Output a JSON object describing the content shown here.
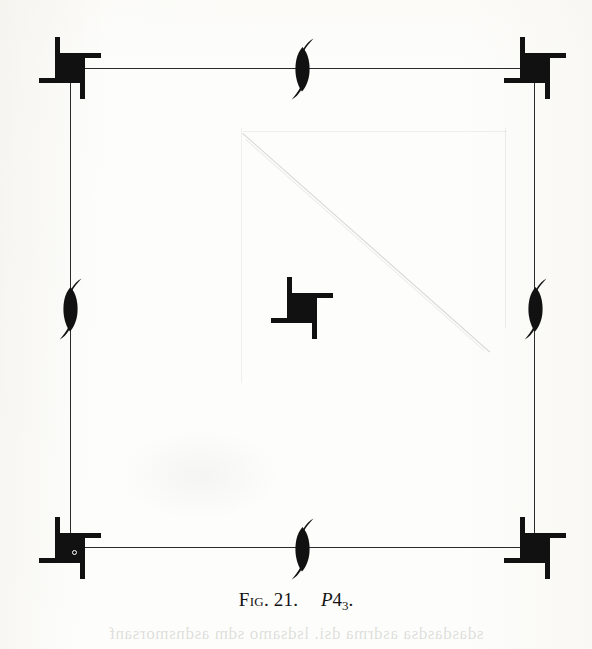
{
  "figure": {
    "caption_prefix": "Fig.",
    "caption_number": "21.",
    "space_group_letter": "P",
    "space_group_order": "4",
    "space_group_subscript": "3",
    "space_group_period": ".",
    "title_full": "Fig. 21.  P43.",
    "kind": "space-group-symmetry-diagram",
    "bleed_through_text": "sdasdasdsa asdrma dsi. lsdsamo sdm asdnsmorsanf"
  },
  "cell": {
    "shape": "square",
    "frame_color": "#2b2b2b",
    "frame_stroke_px": 1.4,
    "left_px": 70,
    "top_px": 68,
    "width_px": 465,
    "height_px": 480
  },
  "symbols": {
    "fourfold_screw": {
      "name": "4-3 screw axis",
      "label": "4_3",
      "glyph": "filled-square-with-four-tails",
      "fill": "#111111",
      "positions": [
        {
          "id": "corner-top-left",
          "cx": 70,
          "cy": 68,
          "has_origin_dot": false
        },
        {
          "id": "corner-top-right",
          "cx": 535,
          "cy": 68,
          "has_origin_dot": false
        },
        {
          "id": "corner-bottom-left",
          "cx": 70,
          "cy": 548,
          "has_origin_dot": true
        },
        {
          "id": "corner-bottom-right",
          "cx": 535,
          "cy": 548,
          "has_origin_dot": false
        },
        {
          "id": "cell-center",
          "cx": 302,
          "cy": 308,
          "has_origin_dot": false
        }
      ]
    },
    "twofold_screw": {
      "name": "2-1 screw axis",
      "label": "2_1",
      "glyph": "pointed-lens-with-tails",
      "fill": "#111111",
      "positions": [
        {
          "id": "edge-top",
          "cx": 302,
          "cy": 68
        },
        {
          "id": "edge-bottom",
          "cx": 302,
          "cy": 548
        },
        {
          "id": "edge-left",
          "cx": 70,
          "cy": 308
        },
        {
          "id": "edge-right",
          "cx": 535,
          "cy": 308
        }
      ]
    },
    "origin_marker": {
      "name": "origin circle",
      "glyph": "small-open-circle",
      "at": "corner-bottom-left"
    }
  },
  "page": {
    "background": "#fdfdfb",
    "ink": "#111111",
    "width_px": 592,
    "height_px": 649
  }
}
